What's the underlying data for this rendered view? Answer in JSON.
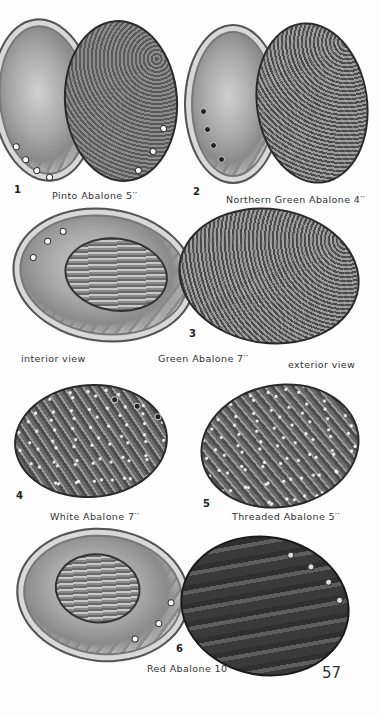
{
  "page": {
    "page_number": "57",
    "figures": [
      {
        "number": "1",
        "label": "Pinto Abalone 5′′"
      },
      {
        "number": "2",
        "label": "Northern Green Abalone 4′′"
      },
      {
        "number": "3",
        "label": "Green Abalone 7′′",
        "left_caption": "interior view",
        "right_caption": "exterior view"
      },
      {
        "number": "4",
        "label": "White Abalone 7′′"
      },
      {
        "number": "5",
        "label": "Threaded Abalone 5′′"
      },
      {
        "number": "6",
        "label": "Red Abalone 10′′"
      }
    ]
  }
}
